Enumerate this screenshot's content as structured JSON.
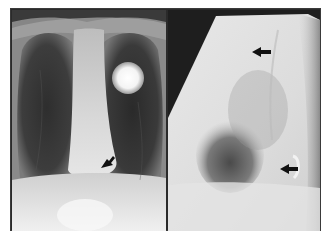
{
  "figure": {
    "panels": [
      {
        "id": "pa",
        "view": "frontal",
        "findings": [
          {
            "type": "round-radiopaque-density",
            "location": "left upper hemithorax"
          },
          {
            "type": "arrow",
            "direction": "pointing-down-left",
            "location": "lower mediastinum"
          }
        ]
      },
      {
        "id": "lat",
        "view": "lateral",
        "findings": [
          {
            "type": "arrow",
            "direction": "pointing-left",
            "location": "upper anterior"
          },
          {
            "type": "arrow",
            "direction": "pointing-left",
            "location": "lower posterior, curved density"
          }
        ]
      }
    ],
    "colors": {
      "frame": "#2a2a2a",
      "background": "#ffffff",
      "arrow": "#111111"
    }
  }
}
